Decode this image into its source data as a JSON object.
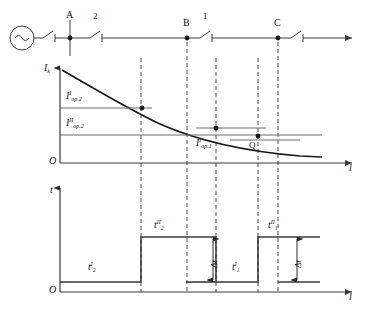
{
  "figure": {
    "axes": {
      "top_plot_y_label": "I",
      "top_plot_y_sub": "k",
      "top_plot_x_label": "l",
      "bottom_plot_y_label": "t",
      "bottom_plot_x_label": "l",
      "origin_label": "O"
    },
    "colors": {
      "line": "#3a3a3a",
      "curve": "#1a1a1a",
      "dashed": "#4a4a4a",
      "text": "#111111",
      "background": "#ffffff"
    }
  },
  "network": {
    "source_symbol": "~",
    "nodes": [
      {
        "name": "A",
        "label": "A",
        "x": 70
      },
      {
        "name": "B",
        "label": "B",
        "x": 187
      },
      {
        "name": "C",
        "label": "C",
        "x": 278
      }
    ],
    "breakers": [
      {
        "name": "breaker-source",
        "label": "",
        "x": 48
      },
      {
        "name": "breaker-2",
        "label": "2",
        "x": 95
      },
      {
        "name": "breaker-1",
        "label": "1",
        "x": 205
      },
      {
        "name": "breaker-3",
        "label": "",
        "x": 296
      }
    ],
    "breaker_labels": [
      "2",
      "1"
    ]
  },
  "current_plot": {
    "curve_name": "short-circuit-current-curve",
    "thresholds": [
      {
        "name": "I_op2_I",
        "base": "I",
        "sub": "op.2",
        "sup": "I",
        "level_y": 108
      },
      {
        "name": "I_op2_II",
        "base": "I",
        "sub": "op.2",
        "sup": "II",
        "level_y": 135
      },
      {
        "name": "I_op1_I",
        "base": "I",
        "sub": "op.1",
        "sup": "I",
        "level_y": 128
      }
    ],
    "points": [
      {
        "name": "intersection-point-1",
        "label": "",
        "x": 142,
        "y": 108
      },
      {
        "name": "intersection-point-2",
        "label": "",
        "x": 216,
        "y": 128
      },
      {
        "name": "point-Q",
        "label": "Q",
        "x": 258,
        "y": 136
      }
    ],
    "labels": {
      "I_op2_I": "I",
      "I_op2_I_sub": "op.2",
      "I_op2_I_sup": "I",
      "I_op2_II": "I",
      "I_op2_II_sub": "op.2",
      "I_op2_II_sup": "II",
      "I_op1_I": "I",
      "I_op1_I_sub": "op.1",
      "I_op1_I_sup": "I",
      "Q": "Q"
    }
  },
  "time_plot": {
    "steps": [
      {
        "name": "t2_I",
        "base": "t",
        "sub": "2",
        "sup": "I",
        "from_x": 60,
        "to_x": 141,
        "level": 282
      },
      {
        "name": "t2_II",
        "base": "t",
        "sub": "2",
        "sup": "II",
        "from_x": 141,
        "to_x": 216,
        "level": 237
      },
      {
        "name": "t1_I",
        "base": "t",
        "sub": "1",
        "sup": "I",
        "from_x": 216,
        "to_x": 258,
        "level": 282
      },
      {
        "name": "t1_II",
        "base": "t",
        "sub": "1",
        "sup": "II",
        "from_x": 258,
        "to_x": 320,
        "level": 237
      }
    ],
    "labels": {
      "t2_I": "t",
      "t2_I_sub": "2",
      "t2_I_sup": "I",
      "t2_II": "t",
      "t2_II_sub": "2",
      "t2_II_sup": "II",
      "t1_I": "t",
      "t1_I_sub": "1",
      "t1_I_sup": "I",
      "t1_II": "t",
      "t1_II_sub": "1",
      "t1_II_sup": "II"
    },
    "delta_markers": [
      {
        "name": "delta-t-left",
        "label": "Δt",
        "x": 213,
        "top": 237,
        "bottom": 282
      },
      {
        "name": "delta-t-right",
        "label": "Δt",
        "x": 297,
        "top": 237,
        "bottom": 282
      }
    ],
    "delta_label": "Δt"
  },
  "dashed_guides": [
    {
      "name": "guide-1",
      "x": 141
    },
    {
      "name": "guide-B",
      "x": 187
    },
    {
      "name": "guide-2",
      "x": 216
    },
    {
      "name": "guide-Q",
      "x": 258
    },
    {
      "name": "guide-C",
      "x": 278
    }
  ]
}
